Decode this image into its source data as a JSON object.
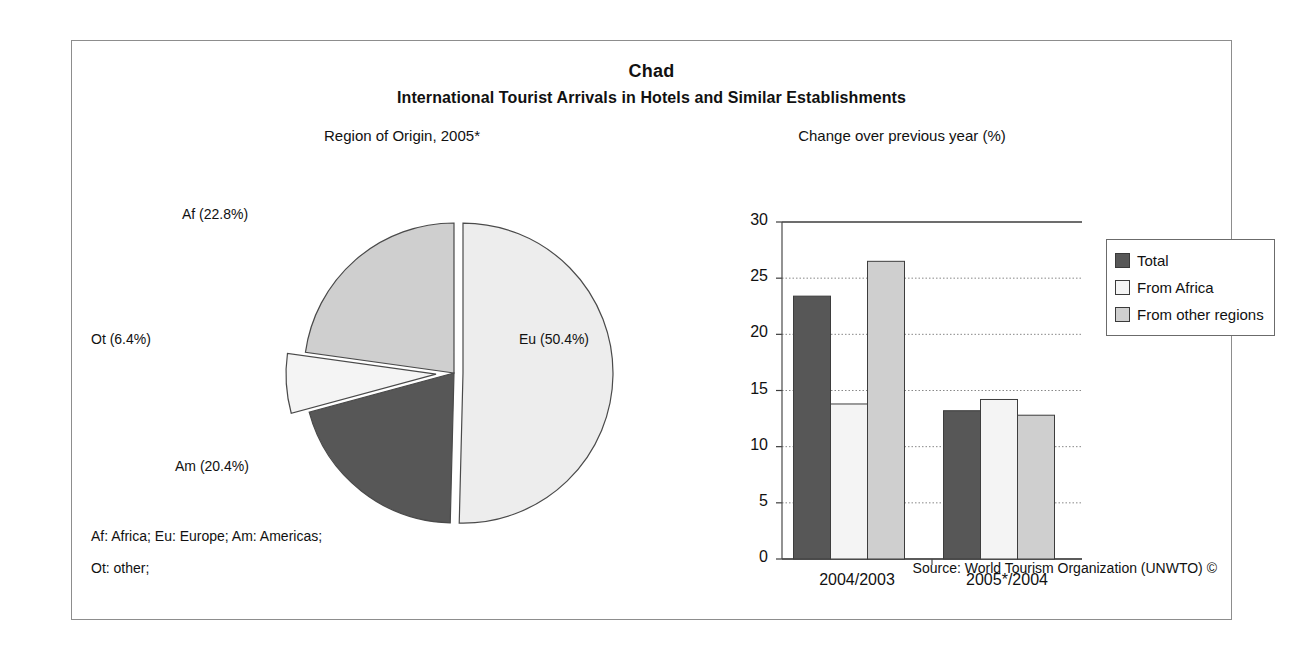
{
  "header": {
    "country": "Chad",
    "title": "International Tourist Arrivals in Hotels and Similar Establishments"
  },
  "panels": {
    "pie_caption": "Region of Origin, 2005*",
    "bar_caption": "Change over previous year (%)"
  },
  "footnotes": {
    "line1": "Af: Africa; Eu: Europe; Am: Americas;",
    "line2": "Ot: other;",
    "source": "Source: World Tourism Organization (UNWTO) ©"
  },
  "colors": {
    "dark": "#575757",
    "white": "#f4f4f4",
    "light": "#cfcfcf",
    "lighter": "#ededed",
    "outline": "#4a4a4a",
    "frame": "#8d8d8d",
    "grid": "#7a7a7a"
  },
  "chart_data": [
    {
      "type": "pie",
      "title": "Region of Origin, 2005*",
      "categories": [
        "Eu",
        "Am",
        "Ot",
        "Af"
      ],
      "labels": [
        "Eu (50.4%)",
        "Am (20.4%)",
        "Ot (6.4%)",
        "Af (22.8%)"
      ],
      "values": [
        50.4,
        20.4,
        6.4,
        22.8
      ],
      "unit": "%",
      "legend": "none",
      "exploded": [
        "Eu",
        "Ot"
      ],
      "slice_fills": [
        "#ededed",
        "#575757",
        "#f4f4f4",
        "#cfcfcf"
      ]
    },
    {
      "type": "bar",
      "title": "Change over previous year (%)",
      "xlabel": "",
      "ylabel": "",
      "ylim": [
        0,
        30
      ],
      "yticks": [
        0,
        5,
        10,
        15,
        20,
        25,
        30
      ],
      "grid": true,
      "legend_position": "right",
      "categories": [
        "2004/2003",
        "2005*/2004"
      ],
      "series": [
        {
          "name": "Total",
          "values": [
            23.4,
            13.2
          ],
          "fill": "#575757"
        },
        {
          "name": "From Africa",
          "values": [
            13.8,
            14.2
          ],
          "fill": "#f4f4f4"
        },
        {
          "name": "From other regions",
          "values": [
            26.5,
            12.8
          ],
          "fill": "#cfcfcf"
        }
      ]
    }
  ]
}
